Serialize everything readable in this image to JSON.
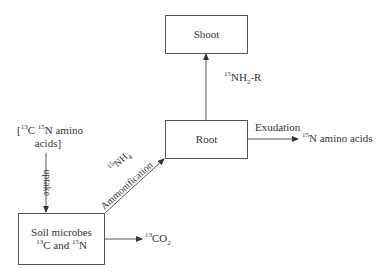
{
  "nodes": {
    "shoot": {
      "label": "Shoot"
    },
    "root": {
      "label": "Root"
    },
    "soil_microbes": {
      "line1": "Soil microbes",
      "line2": {
        "iso1": "13",
        "el1": "C and ",
        "iso2": "15",
        "el2": "N"
      }
    }
  },
  "external": {
    "input_amino": {
      "open": "[",
      "iso1": "13",
      "el1": "C ",
      "iso2": "15",
      "el2": "N amino",
      "line2": "acids]"
    },
    "output_amino": {
      "iso": "15",
      "text": "N amino acids"
    },
    "co2": {
      "iso": "13",
      "el": "CO",
      "sub": "2"
    }
  },
  "edges": {
    "uptake": {
      "label": "uptake"
    },
    "ammonification": {
      "iso": "15",
      "el": "NH",
      "sub": "4",
      "label": "Ammonification"
    },
    "root_to_shoot": {
      "iso": "15",
      "el": "NH",
      "sub": "2",
      "suffix": "-R"
    },
    "exudation": {
      "label": "Exudation"
    }
  },
  "colors": {
    "line": "#555555",
    "text": "#333333"
  }
}
